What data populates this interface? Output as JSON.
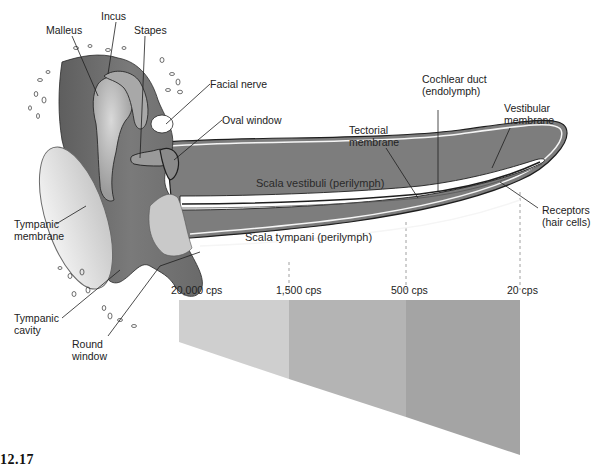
{
  "figure": {
    "number": "12.17"
  },
  "labels": {
    "malleus": "Malleus",
    "incus": "Incus",
    "stapes": "Stapes",
    "facial_nerve": "Facial nerve",
    "oval_window": "Oval window",
    "tympanic_membrane": "Tympanic\nmembrane",
    "tympanic_cavity": "Tympanic\ncavity",
    "round_window": "Round\nwindow",
    "cochlear_duct": "Cochlear duct\n(endolymph)",
    "tectorial_membrane": "Tectorial\nmembrane",
    "vestibular_membrane": "Vestibular\nmembrane",
    "receptors": "Receptors\n(hair cells)",
    "scala_vestibuli": "Scala vestibuli (perilymph)",
    "scala_tympani": "Scala tympani (perilymph)"
  },
  "frequency_map": {
    "ticks": [
      {
        "label": "20,000 cps",
        "x": 180
      },
      {
        "label": "1,500 cps",
        "x": 289
      },
      {
        "label": "500 cps",
        "x": 406
      },
      {
        "label": "20 cps",
        "x": 520
      }
    ],
    "bands": [
      {
        "from": "20,000 cps",
        "to": "1,500 cps",
        "color": "#cfcfcf"
      },
      {
        "from": "1,500 cps",
        "to": "500 cps",
        "color": "#b3b3b3"
      },
      {
        "from": "500 cps",
        "to": "20 cps",
        "color": "#a3a3a3"
      }
    ]
  },
  "colors": {
    "tissue_dark": "#6e6e6e",
    "tissue_mid": "#8c8c8c",
    "tissue_light": "#bdbdbd",
    "bone": "#d6d6d6",
    "outline": "#1e1e1e"
  }
}
